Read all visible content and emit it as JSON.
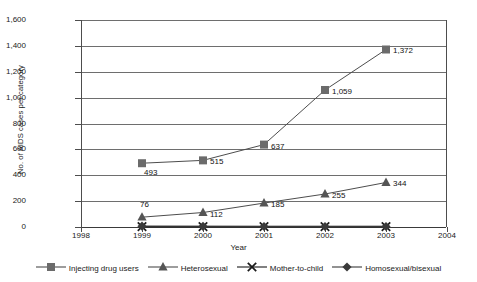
{
  "chart_data": {
    "type": "line",
    "title": "",
    "xlabel": "Year",
    "ylabel": "No. of AIDS cases per category",
    "x": [
      1999,
      2000,
      2001,
      2002,
      2003
    ],
    "xlim": [
      1998,
      2004
    ],
    "ylim": [
      0,
      1600
    ],
    "xticks": [
      "1998",
      "1999",
      "2000",
      "2001",
      "2002",
      "2003",
      "2004"
    ],
    "yticks": [
      "0",
      "200",
      "400",
      "600",
      "800",
      "1,000",
      "1,200",
      "1,400",
      "1,600"
    ],
    "grid": true,
    "legend_position": "bottom",
    "series": [
      {
        "name": "Injecting drug users",
        "marker": "square",
        "color": "#6b6b6b",
        "line_color": "#4d4d4d",
        "values": [
          493,
          515,
          637,
          1059,
          1372
        ],
        "labels": [
          "493",
          "515",
          "637",
          "1,059",
          "1,372"
        ]
      },
      {
        "name": "Heterosexual",
        "marker": "triangle",
        "color": "#555555",
        "line_color": "#4d4d4d",
        "values": [
          76,
          112,
          185,
          255,
          344
        ],
        "labels": [
          "76",
          "112",
          "185",
          "255",
          "344"
        ]
      },
      {
        "name": "Mother-to-child",
        "marker": "x",
        "color": "#1a1a1a",
        "line_color": "#1a1a1a",
        "values": [
          3,
          3,
          3,
          3,
          3
        ],
        "labels": [
          "",
          "",
          "",
          "",
          ""
        ]
      },
      {
        "name": "Homosexual/bisexual",
        "marker": "diamond",
        "color": "#3a3a3a",
        "line_color": "#3a3a3a",
        "values": [
          6,
          5,
          4,
          4,
          4
        ],
        "labels": [
          "",
          "",
          "",
          "",
          ""
        ]
      }
    ]
  },
  "axes": {
    "y_title": "No. of AIDS cases per category",
    "x_title": "Year"
  }
}
